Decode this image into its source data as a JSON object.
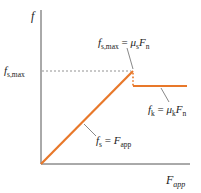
{
  "diagram": {
    "type": "friction-vs-applied-force",
    "colors": {
      "curve": "#E8782A",
      "axis": "#555555",
      "text": "#222222",
      "leader": "#555555",
      "dashed": "#777777"
    },
    "axes": {
      "y_label": {
        "symbol": "f"
      },
      "x_label": {
        "symbol": "F",
        "sub": "app"
      },
      "y_tick": {
        "symbol": "f",
        "sub": "s,max"
      }
    },
    "annotations": {
      "peak": {
        "lhs_sym": "f",
        "lhs_sub": "s,max",
        "eq": " = ",
        "mu": "μ",
        "mu_sub": "s",
        "F": "F",
        "F_sub": "n"
      },
      "kinetic": {
        "lhs_sym": "f",
        "lhs_sub": "k",
        "eq": " = ",
        "mu": "μ",
        "mu_sub": "k",
        "F": "F",
        "F_sub": "n"
      },
      "static": {
        "lhs_sym": "f",
        "lhs_sub": "s",
        "eq": " = ",
        "F": "F",
        "F_sub": "app"
      }
    },
    "points": {
      "origin": [
        41,
        164
      ],
      "peak": [
        133,
        71
      ],
      "kinetic_start": [
        133,
        86
      ],
      "kinetic_end": [
        187,
        86
      ]
    }
  }
}
